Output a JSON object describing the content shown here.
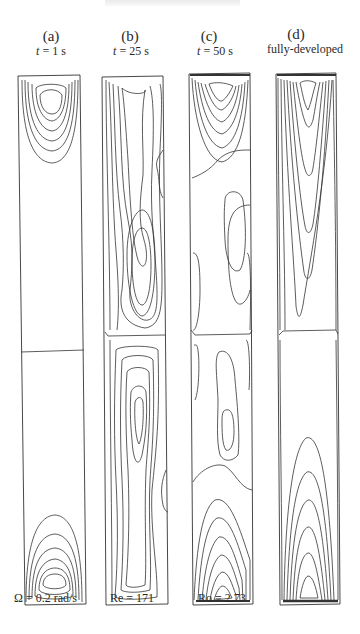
{
  "figure": {
    "panels": [
      {
        "id": "a",
        "label": "(a)",
        "time_var": "t",
        "time_text": " = 1 s",
        "description": "t = 1 s"
      },
      {
        "id": "b",
        "label": "(b)",
        "time_var": "t",
        "time_text": " = 25 s",
        "description": "t = 25 s"
      },
      {
        "id": "c",
        "label": "(c)",
        "time_var": "t",
        "time_text": " = 50 s",
        "description": "t = 50 s"
      },
      {
        "id": "d",
        "label": "(d)",
        "time_var": "",
        "time_text": "fully-developed",
        "description": "fully-developed"
      }
    ],
    "parameters": {
      "omega": "Ω = 0.2 rad/s",
      "reynolds": "Re = 171",
      "rossby": "Ro = 2.73"
    }
  }
}
